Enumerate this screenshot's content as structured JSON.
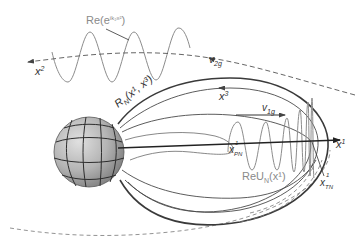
{
  "figure": {
    "labels": {
      "plane_wave": "Re(e",
      "plane_wave_exp": "ik₂x²",
      "plane_wave_close": ")",
      "x2_axis": "x",
      "x2_sup": "2",
      "x3_axis": "x",
      "x3_sup": "3",
      "x1_axis": "x",
      "x1_sup": "1",
      "v2g": "v",
      "v2g_sub": "2g",
      "v1g": "v",
      "v1g_sub": "1g",
      "ray_surface": "R",
      "ray_surface_sub": "N",
      "ray_surface_args": "(x¹, x³)",
      "mode_wave": "ReU",
      "mode_wave_sub": "N",
      "mode_wave_args": "(x¹)",
      "turning_left": "x",
      "turning_left_sup": "1",
      "turning_left_sub": "PN",
      "turning_right": "x",
      "turning_right_sup": "1",
      "turning_right_sub": "TN"
    },
    "colors": {
      "wave": "#8c8c8c",
      "axis": "#222222",
      "sphere_light": "#d6d6d6",
      "sphere_dark": "#7a7a7a"
    }
  }
}
